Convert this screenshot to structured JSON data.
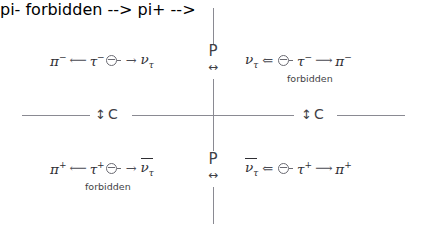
{
  "diagram": {
    "colors": {
      "axis": "#8a8a92",
      "text": "#2e2e33",
      "label": "#3f3f46",
      "arrow": "#4a4a52",
      "background": "#ffffff"
    },
    "symmetry_labels": {
      "p_top": {
        "letter": "P",
        "arrow": "↔"
      },
      "p_bottom": {
        "letter": "P",
        "arrow": "↔"
      },
      "c_left": {
        "arrow": "↕",
        "letter": "C"
      },
      "c_right": {
        "arrow": "↕",
        "letter": "C"
      }
    },
    "quadrants": {
      "top_left": {
        "name": "tau-minus-decay-allowed",
        "particles": {
          "left": {
            "symbol": "π",
            "charge": "−",
            "bar": false,
            "sub": ""
          },
          "middle": {
            "symbol": "τ",
            "charge": "−",
            "bar": false,
            "sub": ""
          },
          "right": {
            "symbol": "ν",
            "charge": "",
            "bar": false,
            "sub": "τ"
          }
        },
        "left_arrow": "⟵",
        "right_arrow": "→",
        "spin": "spin-right",
        "forbidden": false,
        "forbidden_label": ""
      },
      "top_right": {
        "name": "tau-minus-decay-parity-mirrored",
        "particles": {
          "left": {
            "symbol": "ν",
            "charge": "",
            "bar": false,
            "sub": "τ"
          },
          "middle": {
            "symbol": "τ",
            "charge": "−",
            "bar": false,
            "sub": ""
          },
          "right": {
            "symbol": "π",
            "charge": "−",
            "bar": false,
            "sub": ""
          }
        },
        "left_arrow": "⇐",
        "right_arrow": "⟶",
        "spin": "spin-left",
        "forbidden": true,
        "forbidden_label": "forbidden"
      },
      "bottom_left": {
        "name": "tau-plus-decay-charge-conjugated",
        "particles": {
          "left": {
            "symbol": "π",
            "charge": "+",
            "bar": false,
            "sub": ""
          },
          "middle": {
            "symbol": "τ",
            "charge": "+",
            "bar": false,
            "sub": ""
          },
          "right": {
            "symbol": "ν",
            "charge": "",
            "bar": true,
            "sub": "τ"
          }
        },
        "left_arrow": "⟵",
        "right_arrow": "→",
        "spin": "spin-right",
        "forbidden": true,
        "forbidden_label": "forbidden"
      },
      "bottom_right": {
        "name": "tau-plus-decay-cp-transformed",
        "particles": {
          "left": {
            "symbol": "ν",
            "charge": "",
            "bar": true,
            "sub": "τ"
          },
          "middle": {
            "symbol": "τ",
            "charge": "+",
            "bar": false,
            "sub": ""
          },
          "right": {
            "symbol": "π",
            "charge": "+",
            "bar": false,
            "sub": ""
          }
        },
        "left_arrow": "⇐",
        "right_arrow": "⟶",
        "spin": "spin-left",
        "forbidden": false,
        "forbidden_label": ""
      }
    }
  }
}
